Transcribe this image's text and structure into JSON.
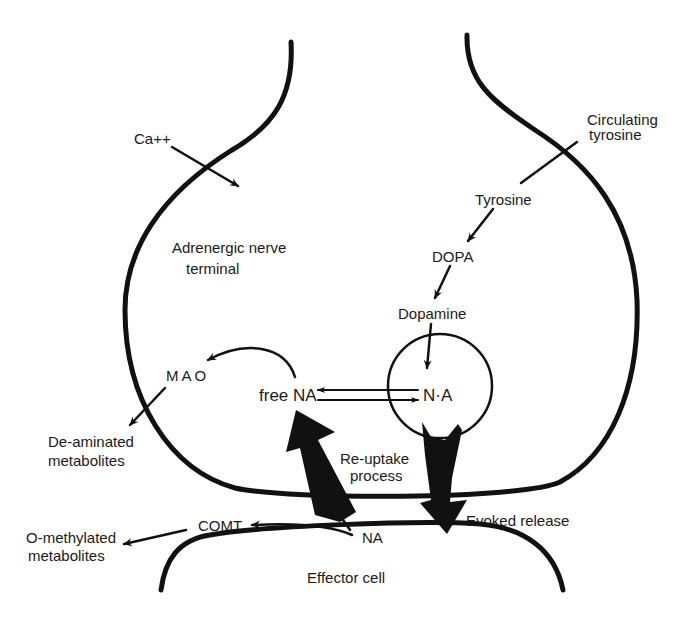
{
  "diagram": {
    "title": "Adrenergic nerve terminal",
    "colors": {
      "ink": "#111111",
      "background": "#ffffff"
    },
    "labels": {
      "calcium": "Ca++",
      "circulating_tyrosine_line1": "Circulating",
      "circulating_tyrosine_line2": "tyrosine",
      "tyrosine": "Tyrosine",
      "dopa": "DOPA",
      "dopamine": "Dopamine",
      "terminal_line1": "Adrenergic nerve",
      "terminal_line2": "terminal",
      "mao": "MAO",
      "free_na": "free NA",
      "vesicle_na": "N·A",
      "deaminated_line1": "De-aminated",
      "deaminated_line2": "metabolites",
      "reuptake_line1": "Re-uptake",
      "reuptake_line2": "process",
      "evoked_release": "Evoked release",
      "comt": "COMT",
      "cleft_na": "NA",
      "omethylated_line1": "O-methylated",
      "omethylated_line2": "metabolites",
      "effector_cell": "Effector cell"
    },
    "nodes": [
      {
        "id": "circulating-tyrosine",
        "label": "Circulating tyrosine"
      },
      {
        "id": "tyrosine",
        "label": "Tyrosine"
      },
      {
        "id": "dopa",
        "label": "DOPA"
      },
      {
        "id": "dopamine",
        "label": "Dopamine"
      },
      {
        "id": "vesicle-na",
        "label": "N·A"
      },
      {
        "id": "free-na",
        "label": "free NA"
      },
      {
        "id": "mao",
        "label": "MAO"
      },
      {
        "id": "deaminated-metabolites",
        "label": "De-aminated metabolites"
      },
      {
        "id": "cleft-na",
        "label": "NA"
      },
      {
        "id": "comt",
        "label": "COMT"
      },
      {
        "id": "o-methylated-metabolites",
        "label": "O-methylated metabolites"
      },
      {
        "id": "effector-cell",
        "label": "Effector cell"
      },
      {
        "id": "calcium",
        "label": "Ca++"
      }
    ],
    "edges": [
      {
        "from": "circulating-tyrosine",
        "to": "tyrosine"
      },
      {
        "from": "tyrosine",
        "to": "dopa"
      },
      {
        "from": "dopa",
        "to": "dopamine"
      },
      {
        "from": "dopamine",
        "to": "vesicle-na"
      },
      {
        "from": "vesicle-na",
        "to": "free-na"
      },
      {
        "from": "free-na",
        "to": "vesicle-na"
      },
      {
        "from": "free-na",
        "to": "mao"
      },
      {
        "from": "mao",
        "to": "deaminated-metabolites"
      },
      {
        "from": "vesicle-na",
        "to": "cleft-na",
        "label": "Evoked release"
      },
      {
        "from": "cleft-na",
        "to": "free-na",
        "label": "Re-uptake process"
      },
      {
        "from": "cleft-na",
        "to": "comt"
      },
      {
        "from": "comt",
        "to": "o-methylated-metabolites"
      },
      {
        "from": "calcium",
        "to": "terminal-interior"
      }
    ]
  }
}
